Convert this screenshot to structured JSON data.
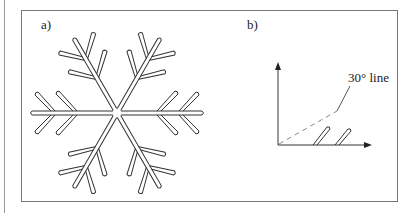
{
  "figure": {
    "panel_a": {
      "label": "a)",
      "content": "snowflake",
      "arms": 6,
      "branches_per_side": 2
    },
    "panel_b": {
      "label": "b)",
      "annotation": "30° line",
      "axes": [
        "x-axis-arrow",
        "y-axis-arrow"
      ],
      "branches_drawn": 2
    },
    "colors": {
      "stroke": "#333333",
      "dashed": "#888888",
      "frame": "#777777"
    }
  }
}
